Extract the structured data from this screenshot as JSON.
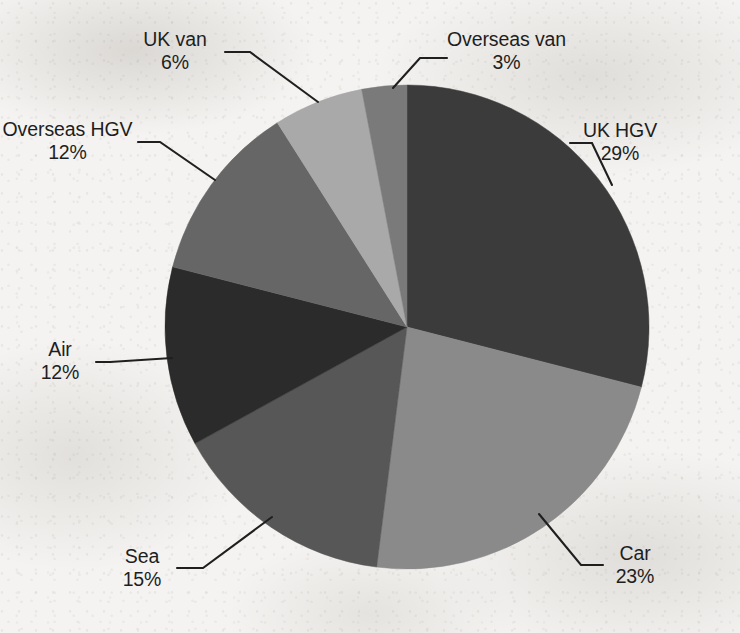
{
  "chart_data": {
    "type": "pie",
    "title": "",
    "subtitle": "",
    "xlabel": "",
    "ylabel": "",
    "grid": false,
    "legend_position": "none",
    "labels_shown": "category-name-and-percent",
    "units": "percent",
    "categories": [
      "UK HGV",
      "Car",
      "Sea",
      "Air",
      "Overseas HGV",
      "UK van",
      "Overseas van"
    ],
    "values": [
      29,
      23,
      15,
      12,
      12,
      6,
      3
    ],
    "slices": [
      {
        "label": "UK HGV",
        "percent": 29,
        "percent_text": "29%",
        "color": "#3b3b3b",
        "start_deg": 0,
        "end_deg": 104.4
      },
      {
        "label": "Car",
        "percent": 23,
        "percent_text": "23%",
        "color": "#8a8a8a",
        "start_deg": 104.4,
        "end_deg": 187.2
      },
      {
        "label": "Sea",
        "percent": 15,
        "percent_text": "15%",
        "color": "#575757",
        "start_deg": 187.2,
        "end_deg": 241.2
      },
      {
        "label": "Air",
        "percent": 12,
        "percent_text": "12%",
        "color": "#2b2b2b",
        "start_deg": 241.2,
        "end_deg": 284.4
      },
      {
        "label": "Overseas HGV",
        "percent": 12,
        "percent_text": "12%",
        "color": "#666666",
        "start_deg": 284.4,
        "end_deg": 327.6
      },
      {
        "label": "UK van",
        "percent": 6,
        "percent_text": "6%",
        "color": "#a9a9a9",
        "start_deg": 327.6,
        "end_deg": 349.2
      },
      {
        "label": "Overseas van",
        "percent": 3,
        "percent_text": "3%",
        "color": "#7a7a7a",
        "start_deg": 349.2,
        "end_deg": 360
      }
    ],
    "geometry": {
      "center_x": 407,
      "center_y": 327,
      "radius": 242,
      "start_angle_deg": 0,
      "direction": "clockwise"
    }
  },
  "labels": {
    "uk_hgv": {
      "name": "UK HGV",
      "pct": "29%"
    },
    "car": {
      "name": "Car",
      "pct": "23%"
    },
    "sea": {
      "name": "Sea",
      "pct": "15%"
    },
    "air": {
      "name": "Air",
      "pct": "12%"
    },
    "overseas_hgv": {
      "name": "Overseas HGV",
      "pct": "12%"
    },
    "uk_van": {
      "name": "UK van",
      "pct": "6%"
    },
    "overseas_van": {
      "name": "Overseas van",
      "pct": "3%"
    }
  },
  "colors": {
    "background": "#f4f3f1",
    "text": "#1e1e1e",
    "leader_line": "#1f1f1f"
  }
}
